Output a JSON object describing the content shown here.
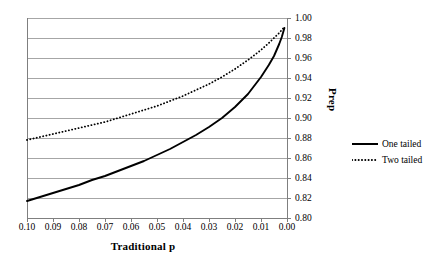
{
  "chart_data": {
    "type": "line",
    "title": "",
    "xlabel": "Traditional p",
    "ylabel": "Prep",
    "xlim": [
      0.1,
      0.0
    ],
    "ylim": [
      0.8,
      1.0
    ],
    "x_reversed": true,
    "grid": true,
    "legend_position": "right",
    "x_ticks": [
      "0.10",
      "0.09",
      "0.08",
      "0.07",
      "0.06",
      "0.05",
      "0.04",
      "0.03",
      "0.02",
      "0.01",
      "0.00"
    ],
    "x_tick_values": [
      0.1,
      0.09,
      0.08,
      0.07,
      0.06,
      0.05,
      0.04,
      0.03,
      0.02,
      0.01,
      0.0
    ],
    "y_ticks": [
      "1.00",
      "0.98",
      "0.96",
      "0.94",
      "0.92",
      "0.90",
      "0.88",
      "0.86",
      "0.84",
      "0.82",
      "0.80"
    ],
    "y_tick_values": [
      1.0,
      0.98,
      0.96,
      0.94,
      0.92,
      0.9,
      0.88,
      0.86,
      0.84,
      0.82,
      0.8
    ],
    "x": [
      0.1,
      0.095,
      0.09,
      0.085,
      0.08,
      0.075,
      0.07,
      0.065,
      0.06,
      0.055,
      0.05,
      0.045,
      0.04,
      0.035,
      0.03,
      0.025,
      0.02,
      0.015,
      0.01,
      0.007,
      0.005,
      0.003,
      0.002,
      0.001
    ],
    "series": [
      {
        "name": "One tailed",
        "style": "solid",
        "color": "#000000",
        "values": [
          0.817,
          0.821,
          0.825,
          0.829,
          0.833,
          0.838,
          0.842,
          0.847,
          0.852,
          0.857,
          0.863,
          0.869,
          0.876,
          0.883,
          0.891,
          0.9,
          0.911,
          0.924,
          0.941,
          0.953,
          0.962,
          0.974,
          0.981,
          0.99
        ]
      },
      {
        "name": "Two tailed",
        "style": "dotted",
        "color": "#000000",
        "values": [
          0.878,
          0.881,
          0.884,
          0.887,
          0.89,
          0.893,
          0.896,
          0.9,
          0.904,
          0.908,
          0.912,
          0.917,
          0.922,
          0.928,
          0.934,
          0.941,
          0.949,
          0.958,
          0.968,
          0.975,
          0.98,
          0.985,
          0.988,
          0.991
        ]
      }
    ]
  },
  "legend": {
    "items": [
      {
        "label": "One tailed",
        "style": "solid"
      },
      {
        "label": "Two tailed",
        "style": "dotted"
      }
    ]
  },
  "axes": {
    "x_title": "Traditional p",
    "y_title": "Prep"
  },
  "colors": {
    "axis": "#7f7f7f",
    "grid": "#a6a6a6",
    "series": "#000000",
    "background": "#ffffff"
  }
}
